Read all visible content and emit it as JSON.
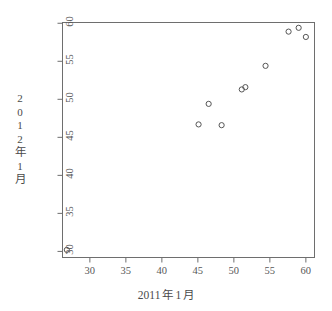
{
  "chart_data": {
    "type": "scatter",
    "title": "",
    "xlabel": "2011 年 1 月",
    "ylabel": "2012 年 1 月",
    "xlabel_parts": [
      "2011",
      "年",
      "1",
      "月"
    ],
    "ylabel_chars": [
      "2",
      "0",
      "1",
      "2",
      "年",
      "1",
      "月"
    ],
    "xlim": [
      26.2,
      61.2
    ],
    "ylim": [
      29.2,
      60.1
    ],
    "xticks": [
      30,
      35,
      40,
      45,
      50,
      55,
      60
    ],
    "yticks": [
      30,
      35,
      40,
      45,
      50,
      55,
      60
    ],
    "xtick_labels": [
      "30",
      "35",
      "40",
      "45",
      "50",
      "55",
      "60"
    ],
    "ytick_labels": [
      "30",
      "35",
      "40",
      "45",
      "50",
      "55",
      "60"
    ],
    "grid": false,
    "legend": null,
    "marker": "open-circle",
    "marker_color": "#555555",
    "points": [
      {
        "x": 26.8,
        "y": 30.2
      },
      {
        "x": 45.1,
        "y": 46.7
      },
      {
        "x": 46.5,
        "y": 49.4
      },
      {
        "x": 48.3,
        "y": 46.6
      },
      {
        "x": 51.1,
        "y": 51.3
      },
      {
        "x": 51.6,
        "y": 51.6
      },
      {
        "x": 54.4,
        "y": 54.4
      },
      {
        "x": 57.6,
        "y": 58.9
      },
      {
        "x": 59.0,
        "y": 59.4
      },
      {
        "x": 60.0,
        "y": 58.2
      }
    ]
  },
  "axis": {
    "x_title": "2011 年 1 月",
    "y_title": "2012 年 1 月"
  },
  "style": {
    "frame_color": "#6e6e6e",
    "tick_color": "#6e6e6e",
    "text_color": "#4d4d4d",
    "point_color": "#555555",
    "background": "#ffffff"
  }
}
